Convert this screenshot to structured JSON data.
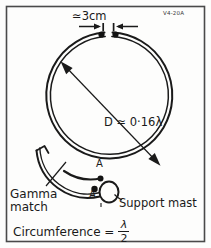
{
  "figure": {
    "code_label": "V4-20A",
    "background_color": "#fdfdfc",
    "ink_color": "#1a1a1a",
    "border_color": "#4a4a4a"
  },
  "annotations": {
    "gap_dimension": "≃3cm",
    "diameter": "D ≃ 0·16λ",
    "terminal_top": "A",
    "terminal_bottom": "A",
    "gamma_match_line1": "Gamma",
    "gamma_match_line2": "match",
    "support_mast": "Support mast"
  },
  "formula": {
    "circumference_label": "Circumference =",
    "numerator": "λ",
    "denominator": "2"
  }
}
